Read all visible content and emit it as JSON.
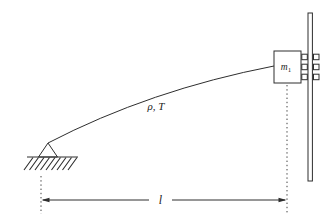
{
  "figure": {
    "background": "#ffffff",
    "line_color": "#2e2e2e",
    "text_color": "#1c1c1c"
  },
  "labels": {
    "cable_properties": "ρ, T",
    "mass_symbol": "m",
    "mass_subscript": "1",
    "span_length": "l"
  },
  "icons": {
    "pin_support": "triangle-on-hatched-ground",
    "hatching": "diagonal-ground-hatch-strokes",
    "rail": "double-vertical-guide-line",
    "rollers": "three-square-pairs-on-rail",
    "dimension_line": "double-headed-arrow-with-center-label",
    "extension_lines": "dotted-vertical-reference-lines"
  }
}
